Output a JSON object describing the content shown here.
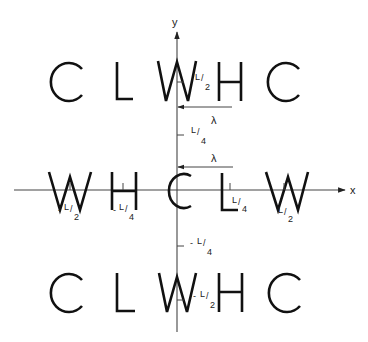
{
  "diagram": {
    "axes": {
      "x_label": "x",
      "y_label": "y",
      "origin": [
        177,
        190
      ]
    },
    "rows": {
      "top": [
        "C",
        "L",
        "W",
        "H",
        "C"
      ],
      "middle": [
        "W",
        "H",
        "C",
        "L",
        "W"
      ],
      "bottom": [
        "C",
        "L",
        "W",
        "H",
        "C"
      ]
    },
    "tick_labels": {
      "y_pos_half": {
        "prefix": "",
        "num": "L",
        "den": "2"
      },
      "y_pos_quarter": {
        "prefix": "",
        "num": "L",
        "den": "4"
      },
      "y_neg_quarter": {
        "prefix": "-",
        "num": "L",
        "den": "4"
      },
      "y_neg_half": {
        "prefix": "-",
        "num": "L",
        "den": "2"
      },
      "x_neg_half": {
        "prefix": "-",
        "num": "L",
        "den": "2"
      },
      "x_neg_quarter": {
        "prefix": "-",
        "num": "L",
        "den": "4"
      },
      "x_pos_quarter": {
        "prefix": "",
        "num": "L",
        "den": "4"
      },
      "x_pos_half": {
        "prefix": "",
        "num": "L",
        "den": "2"
      }
    },
    "wavelength_markers": [
      {
        "label": "λ"
      },
      {
        "label": "λ"
      }
    ]
  }
}
